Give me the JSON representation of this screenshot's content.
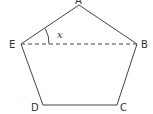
{
  "diagram": {
    "type": "pentagon",
    "stroke_color": "#444444",
    "vertices": [
      {
        "name": "A",
        "x": 79,
        "y": 5,
        "label_x": 76,
        "label_y": 4
      },
      {
        "name": "B",
        "x": 137,
        "y": 44,
        "label_x": 141,
        "label_y": 48
      },
      {
        "name": "C",
        "x": 117,
        "y": 105,
        "label_x": 120,
        "label_y": 111
      },
      {
        "name": "D",
        "x": 43,
        "y": 105,
        "label_x": 31,
        "label_y": 111
      },
      {
        "name": "E",
        "x": 21,
        "y": 44,
        "label_x": 9,
        "label_y": 48
      }
    ],
    "dashed_segment": {
      "from": "E",
      "to": "B"
    },
    "angle": {
      "vertex": "E",
      "between": [
        "A",
        "B"
      ],
      "label": "x"
    }
  }
}
